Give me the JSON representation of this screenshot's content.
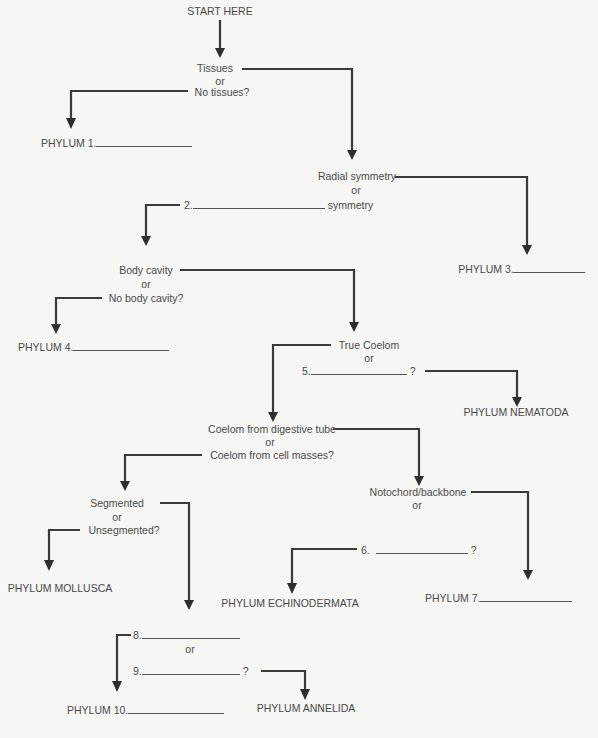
{
  "title": "START HERE",
  "nodes": {
    "tissues": {
      "a": "Tissues",
      "or": "or",
      "b": "No tissues?"
    },
    "symmetry": {
      "a": "Radial symmetry",
      "or": "or",
      "b": "symmetry",
      "blank_num": "2."
    },
    "body_cavity": {
      "a": "Body cavity",
      "or": "or",
      "b": "No body cavity?"
    },
    "coelom": {
      "a": "True Coelom",
      "or": "or",
      "blank_num": "5.",
      "q": "?"
    },
    "coelom_origin": {
      "a": "Coelom from digestive tube",
      "or": "or",
      "b": "Coelom from cell masses?"
    },
    "segmented": {
      "a": "Segmented",
      "or": "or",
      "b": "Unsegmented?"
    },
    "notochord": {
      "a": "Notochord/backbone",
      "or": "or",
      "blank_num": "6.",
      "q": "?"
    },
    "q8_9": {
      "n8": "8.",
      "or": "or",
      "n9": "9.",
      "q": "?"
    }
  },
  "phyla": {
    "p1": "PHYLUM 1.",
    "p3": "PHYLUM 3.",
    "p4": "PHYLUM 4.",
    "nematoda": "PHYLUM NEMATODA",
    "mollusca": "PHYLUM MOLLUSCA",
    "echinodermata": "PHYLUM ECHINODERMATA",
    "p7": "PHYLUM 7.",
    "p10": "PHYLUM 10.",
    "annelida": "PHYLUM ANNELIDA"
  }
}
